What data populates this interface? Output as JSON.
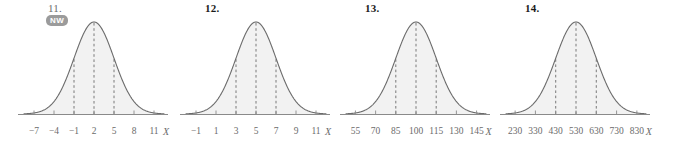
{
  "figure": {
    "axis_variable": "X",
    "badge": {
      "label": "NW"
    },
    "colors": {
      "curve_stroke": "#6b6b6b",
      "curve_fill": "#f2f2f2",
      "axis": "#8a8a8a",
      "tick_text": "#6b6b6b",
      "number_text": "#1a1a1a",
      "badge_background": "#9b9b9b",
      "badge_text": "#ffffff"
    }
  },
  "problems": [
    {
      "number": "11.",
      "has_badge": true,
      "tick_labels": [
        "−7",
        "−4",
        "−1",
        "2",
        "5",
        "8",
        "11"
      ],
      "axis_variable": "X",
      "chart_data": {
        "type": "line",
        "title": "11.",
        "xlabel": "X",
        "ylabel": "",
        "distribution": "normal",
        "mean": 2,
        "std": 3,
        "xlim": [
          -8.5,
          12.5
        ],
        "x": [
          -7,
          -4,
          -1,
          2,
          5,
          8,
          11
        ],
        "tick_values": [
          -7,
          -4,
          -1,
          2,
          5,
          8,
          11
        ],
        "dashed_lines_at": [
          -1,
          2,
          5
        ],
        "grid": false,
        "legend": "none"
      }
    },
    {
      "number": "12.",
      "has_badge": false,
      "tick_labels": [
        "−1",
        "1",
        "3",
        "5",
        "7",
        "9",
        "11"
      ],
      "axis_variable": "X",
      "chart_data": {
        "type": "line",
        "title": "12.",
        "xlabel": "X",
        "ylabel": "",
        "distribution": "normal",
        "mean": 5,
        "std": 2,
        "xlim": [
          -2,
          12
        ],
        "x": [
          -1,
          1,
          3,
          5,
          7,
          9,
          11
        ],
        "tick_values": [
          -1,
          1,
          3,
          5,
          7,
          9,
          11
        ],
        "dashed_lines_at": [
          3,
          5,
          7
        ],
        "grid": false,
        "legend": "none"
      }
    },
    {
      "number": "13.",
      "has_badge": false,
      "tick_labels": [
        "55",
        "70",
        "85",
        "100",
        "115",
        "130",
        "145"
      ],
      "axis_variable": "X",
      "chart_data": {
        "type": "line",
        "title": "13.",
        "xlabel": "X",
        "ylabel": "",
        "distribution": "normal",
        "mean": 100,
        "std": 15,
        "xlim": [
          48,
          152
        ],
        "x": [
          55,
          70,
          85,
          100,
          115,
          130,
          145
        ],
        "tick_values": [
          55,
          70,
          85,
          100,
          115,
          130,
          145
        ],
        "dashed_lines_at": [
          85,
          100,
          115
        ],
        "grid": false,
        "legend": "none"
      }
    },
    {
      "number": "14.",
      "has_badge": false,
      "tick_labels": [
        "230",
        "330",
        "430",
        "530",
        "630",
        "730",
        "830"
      ],
      "axis_variable": "X",
      "chart_data": {
        "type": "line",
        "title": "14.",
        "xlabel": "X",
        "ylabel": "",
        "distribution": "normal",
        "mean": 530,
        "std": 100,
        "xlim": [
          185,
          875
        ],
        "x": [
          230,
          330,
          430,
          530,
          630,
          730,
          830
        ],
        "tick_values": [
          230,
          330,
          430,
          530,
          630,
          730,
          830
        ],
        "dashed_lines_at": [
          430,
          530,
          630
        ],
        "grid": false,
        "legend": "none"
      }
    }
  ]
}
